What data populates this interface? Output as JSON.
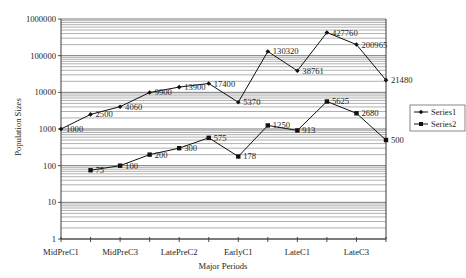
{
  "chart_data": {
    "type": "line",
    "title": "",
    "xlabel": "Major Periods",
    "ylabel": "Population Sizes",
    "yscale": "log",
    "ylim": [
      1,
      1000000
    ],
    "y_ticks": [
      "1",
      "10",
      "100",
      "1000",
      "10000",
      "100000",
      "1000000"
    ],
    "categories": [
      "MidPreC1",
      "",
      "MidPreC3",
      "",
      "LatePreC2",
      "",
      "EarlyC1",
      "",
      "LateC1",
      "",
      "LateC3",
      ""
    ],
    "grid": true,
    "legend_position": "right",
    "series": [
      {
        "name": "Series1",
        "marker": "diamond",
        "color": "#111111",
        "values": [
          1000,
          2500,
          4060,
          9900,
          13900,
          17400,
          5370,
          130320,
          38761,
          427760,
          200965,
          21480
        ]
      },
      {
        "name": "Series2",
        "marker": "square",
        "color": "#111111",
        "values": [
          null,
          75,
          100,
          200,
          300,
          575,
          178,
          1250,
          913,
          5625,
          2680,
          500
        ]
      }
    ]
  }
}
